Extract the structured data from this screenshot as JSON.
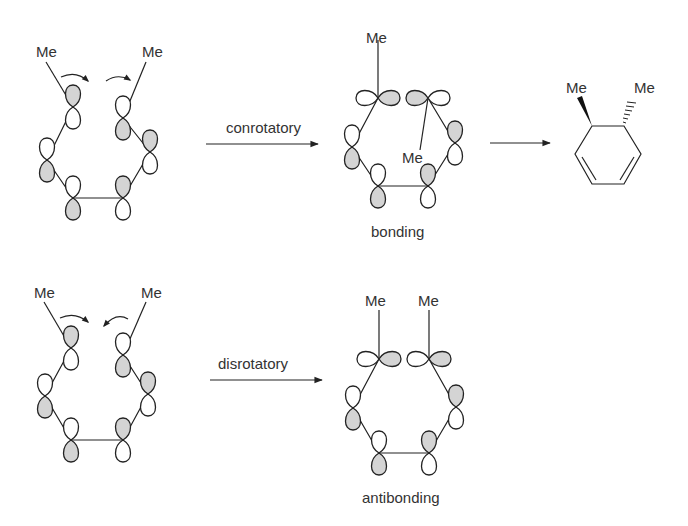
{
  "diagram": {
    "type": "pericyclic electrocyclic ring closure orbital diagram",
    "rows": [
      {
        "name": "conrotatory",
        "reactant": {
          "substituents": [
            "Me",
            "Me"
          ],
          "rotation_arrows": "both clockwise"
        },
        "arrow_label": "conrotatory",
        "intermediate": {
          "substituents": [
            "Me",
            "Me"
          ],
          "caption": "bonding"
        },
        "product": {
          "substituents": [
            "Me",
            "Me"
          ],
          "stereo": "trans (wedge + hash)",
          "arrow": true
        }
      },
      {
        "name": "disrotatory",
        "reactant": {
          "substituents": [
            "Me",
            "Me"
          ],
          "rotation_arrows": "opposite (inward)"
        },
        "arrow_label": "disrotatory",
        "intermediate": {
          "substituents": [
            "Me",
            "Me"
          ],
          "caption": "antibonding"
        }
      }
    ]
  },
  "labels": {
    "me": "Me",
    "conrotatory": "conrotatory",
    "disrotatory": "disrotatory",
    "bonding": "bonding",
    "antibonding": "antibonding"
  },
  "colors": {
    "shaded_lobe": "#d4d4d4",
    "line": "#222222",
    "text": "#333333"
  }
}
